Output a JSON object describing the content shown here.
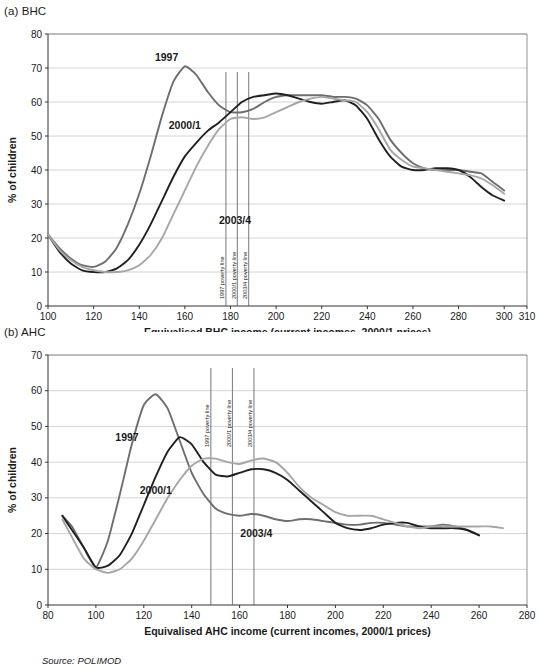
{
  "figure": {
    "source_note": "Source: POLIMOD"
  },
  "panels": [
    {
      "id": "bhc",
      "title": "(a) BHC",
      "chart_data": {
        "type": "line",
        "title": "(a) BHC",
        "xlabel": "Equivalised BHC income (current incomes, 2000/1 prices)",
        "ylabel": "% of children",
        "xlim": [
          100,
          310
        ],
        "ylim": [
          0,
          80
        ],
        "xticks": [
          100,
          120,
          140,
          160,
          180,
          200,
          220,
          240,
          260,
          280,
          300,
          310
        ],
        "yticks": [
          0,
          10,
          20,
          30,
          40,
          50,
          60,
          70,
          80
        ],
        "grid": "horizontal",
        "legend": "inline-labels",
        "annotations": [
          {
            "label": "1997 poverty line",
            "x": 178
          },
          {
            "label": "2000/1 poverty line",
            "x": 183
          },
          {
            "label": "2003/4 poverty line",
            "x": 188
          }
        ],
        "series": [
          {
            "name": "1997",
            "color": "#6e6e6e",
            "label_x": 152,
            "label_y": 72,
            "x": [
              100,
              105,
              110,
              115,
              120,
              125,
              130,
              135,
              140,
              145,
              150,
              155,
              160,
              165,
              170,
              175,
              180,
              185,
              190,
              195,
              200,
              205,
              210,
              215,
              220,
              225,
              230,
              235,
              240,
              245,
              250,
              255,
              260,
              265,
              270,
              275,
              280,
              285,
              290,
              295,
              300
            ],
            "y": [
              21,
              17,
              14,
              12,
              11.5,
              13,
              17,
              24,
              33,
              44,
              56,
              66,
              70.5,
              68,
              63,
              59,
              57,
              57,
              58,
              60,
              61.5,
              62,
              62,
              62,
              62,
              61.5,
              61.5,
              61,
              59,
              55,
              49,
              45,
              42,
              40.5,
              40,
              40,
              40,
              39.5,
              39,
              36.5,
              34
            ]
          },
          {
            "name": "2000/1",
            "color": "#231f20",
            "label_x": 160,
            "label_y": 52,
            "x": [
              100,
              105,
              110,
              115,
              120,
              125,
              130,
              135,
              140,
              145,
              150,
              155,
              160,
              165,
              170,
              175,
              180,
              185,
              190,
              195,
              200,
              205,
              210,
              215,
              220,
              225,
              230,
              235,
              240,
              245,
              250,
              255,
              260,
              265,
              270,
              275,
              280,
              285,
              290,
              295,
              300
            ],
            "y": [
              21,
              16,
              12.5,
              10.5,
              10,
              10,
              11,
              13.5,
              18,
              24,
              31,
              38,
              44,
              48,
              51.5,
              54,
              57,
              60,
              61.5,
              62,
              62.5,
              62,
              61,
              60,
              59.5,
              60,
              60.5,
              59,
              55,
              49,
              44,
              41,
              40,
              40,
              40.5,
              40.5,
              40,
              38,
              35,
              32.5,
              31
            ]
          },
          {
            "name": "2003/4",
            "color": "#a6a6a6",
            "label_x": 182,
            "label_y": 24,
            "x": [
              100,
              105,
              110,
              115,
              120,
              125,
              130,
              135,
              140,
              145,
              150,
              155,
              160,
              165,
              170,
              175,
              180,
              185,
              190,
              195,
              200,
              205,
              210,
              215,
              220,
              225,
              230,
              235,
              240,
              245,
              250,
              255,
              260,
              265,
              270,
              275,
              280,
              285,
              290,
              295,
              300
            ],
            "y": [
              21,
              16.5,
              13.5,
              11.5,
              10.5,
              10,
              10,
              10.5,
              12,
              15,
              20,
              27,
              34,
              41,
              47,
              52,
              55,
              55.5,
              55,
              55.5,
              57,
              58.5,
              60,
              61,
              61.5,
              61,
              60.5,
              60,
              57,
              52,
              46,
              43,
              41,
              40.5,
              40,
              39.5,
              39,
              38.5,
              37.5,
              35.5,
              33
            ]
          }
        ]
      }
    },
    {
      "id": "ahc",
      "title": "(b) AHC",
      "chart_data": {
        "type": "line",
        "title": "(b) AHC",
        "xlabel": "Equivalised AHC income (current incomes, 2000/1 prices)",
        "ylabel": "% of children",
        "xlim": [
          80,
          280
        ],
        "ylim": [
          0,
          70
        ],
        "xticks": [
          80,
          100,
          120,
          140,
          160,
          180,
          200,
          220,
          240,
          260,
          280
        ],
        "yticks": [
          0,
          10,
          20,
          30,
          40,
          50,
          60,
          70
        ],
        "grid": "horizontal",
        "legend": "inline-labels",
        "annotations": [
          {
            "label": "1997 poverty line",
            "x": 148
          },
          {
            "label": "2000/1 poverty line",
            "x": 157
          },
          {
            "label": "2003/4 poverty line",
            "x": 166
          }
        ],
        "series": [
          {
            "name": "1997",
            "color": "#6e6e6e",
            "label_x": 113,
            "label_y": 46,
            "x": [
              86,
              90,
              95,
              100,
              105,
              110,
              115,
              120,
              125,
              130,
              135,
              140,
              145,
              150,
              155,
              160,
              165,
              170,
              175,
              180,
              185,
              190,
              195,
              200,
              205,
              210,
              215,
              220,
              225,
              230,
              235,
              240,
              245,
              250,
              255,
              260
            ],
            "y": [
              25,
              22,
              16,
              10.5,
              18,
              31,
              45,
              56,
              59,
              55,
              46,
              37,
              31,
              27,
              25.5,
              25,
              25.5,
              25,
              24,
              23.5,
              24,
              24,
              23.5,
              23,
              22.5,
              22.5,
              23,
              23,
              22.5,
              22,
              22,
              22,
              22.5,
              22,
              21,
              19.5
            ]
          },
          {
            "name": "2000/1",
            "color": "#231f20",
            "label_x": 125,
            "label_y": 31,
            "x": [
              86,
              90,
              95,
              100,
              105,
              110,
              115,
              120,
              125,
              130,
              135,
              140,
              145,
              150,
              155,
              160,
              165,
              170,
              175,
              180,
              185,
              190,
              195,
              200,
              205,
              210,
              215,
              220,
              225,
              230,
              235,
              240,
              245,
              250,
              255,
              260
            ],
            "y": [
              25,
              21,
              16,
              10.5,
              11,
              14,
              20,
              28,
              36,
              43,
              47,
              45,
              40,
              36.5,
              36,
              37,
              38,
              38,
              37,
              35,
              32,
              29,
              26,
              23,
              21.5,
              21,
              21.5,
              22.5,
              23,
              23,
              22,
              21.5,
              21.5,
              21.5,
              21,
              19.5
            ]
          },
          {
            "name": "2003/4",
            "color": "#a6a6a6",
            "label_x": 167,
            "label_y": 19,
            "x": [
              86,
              90,
              95,
              100,
              105,
              110,
              115,
              120,
              125,
              130,
              135,
              140,
              145,
              150,
              155,
              160,
              165,
              170,
              175,
              180,
              185,
              190,
              195,
              200,
              205,
              210,
              215,
              220,
              225,
              230,
              235,
              240,
              245,
              250,
              255,
              260,
              265,
              270
            ],
            "y": [
              24,
              19,
              13,
              10,
              9,
              10,
              13,
              18,
              24,
              30,
              35,
              39,
              41,
              41,
              40,
              39.5,
              40.5,
              41,
              40,
              37,
              33,
              30,
              28,
              26,
              25,
              25,
              25,
              24,
              23,
              22,
              21.5,
              22,
              22,
              22,
              22,
              22,
              22,
              21.5
            ]
          }
        ]
      }
    }
  ]
}
